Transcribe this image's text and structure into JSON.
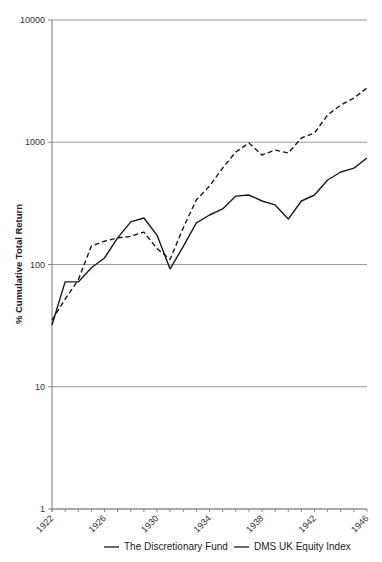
{
  "chart_data": {
    "type": "line",
    "title": "",
    "xlabel": "",
    "ylabel": "% Cumulative Total Return",
    "yscale": "log",
    "ylim": [
      1,
      10000
    ],
    "xlim": [
      1922,
      1946
    ],
    "grid": "horizontal at decades",
    "legend_position": "bottom",
    "y_ticks": [
      "1",
      "10",
      "100",
      "1000",
      "10000"
    ],
    "x_ticks": [
      "1922",
      "1926",
      "1930",
      "1934",
      "1938",
      "1942",
      "1946"
    ],
    "x": [
      1922,
      1923,
      1924,
      1925,
      1926,
      1927,
      1928,
      1929,
      1930,
      1931,
      1932,
      1933,
      1934,
      1935,
      1936,
      1937,
      1938,
      1939,
      1940,
      1941,
      1942,
      1943,
      1944,
      1945,
      1946
    ],
    "series": [
      {
        "name": "The Discretionary Fund",
        "style": "dashed",
        "values": [
          35,
          52,
          75,
          142,
          155,
          165,
          170,
          184,
          135,
          110,
          200,
          338,
          438,
          615,
          832,
          986,
          787,
          863,
          817,
          1083,
          1190,
          1671,
          2018,
          2301,
          2780
        ]
      },
      {
        "name": "DMS UK Equity Index",
        "style": "solid",
        "values": [
          32,
          72,
          72,
          94,
          113,
          165,
          223,
          240,
          174,
          92,
          141,
          219,
          254,
          285,
          363,
          370,
          331,
          307,
          235,
          331,
          370,
          491,
          571,
          615,
          743
        ]
      }
    ]
  },
  "legend": [
    {
      "label": "The Discretionary Fund"
    },
    {
      "label": "DMS UK Equity Index"
    }
  ],
  "colors": {
    "line": "#1a1a1a",
    "grid": "#9a9a9a",
    "axis": "#8a8a8a"
  }
}
